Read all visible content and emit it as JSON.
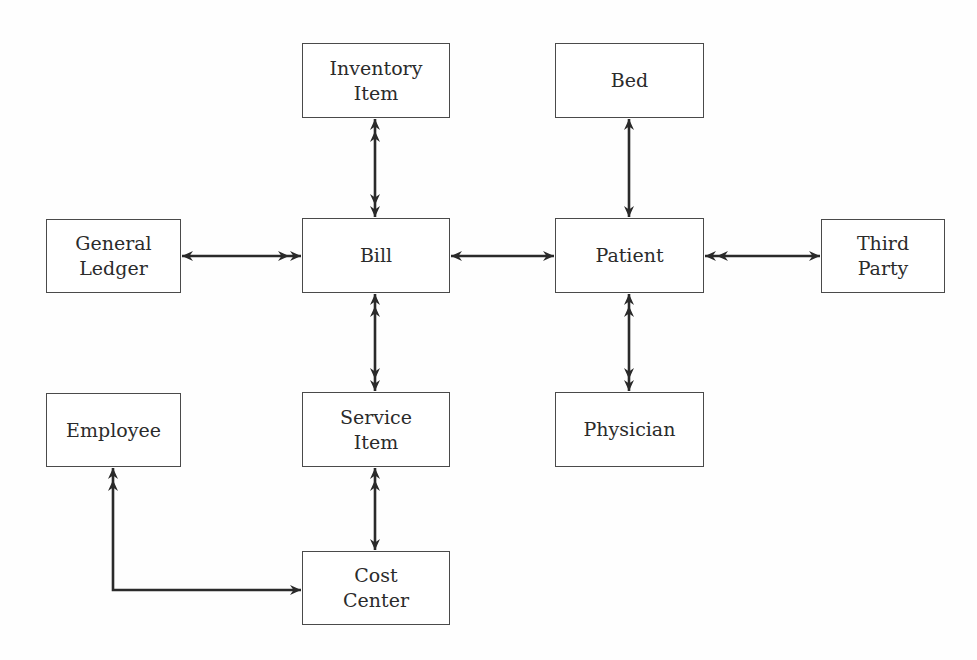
{
  "diagram": {
    "type": "entity-relationship",
    "notation": "single arrowhead = one, double arrowhead = many",
    "colors": {
      "background": "#fefefe",
      "box_border": "#4a4a4a",
      "text": "#2b2b2b",
      "link": "#2a2a2a"
    },
    "entities": [
      {
        "id": "inventory_item",
        "lines": [
          "Inventory",
          "Item"
        ],
        "x": 302,
        "y": 43,
        "w": 148,
        "h": 75
      },
      {
        "id": "bed",
        "lines": [
          "Bed"
        ],
        "x": 555,
        "y": 43,
        "w": 149,
        "h": 75
      },
      {
        "id": "general_ledger",
        "lines": [
          "General",
          "Ledger"
        ],
        "x": 46,
        "y": 219,
        "w": 135,
        "h": 74
      },
      {
        "id": "bill",
        "lines": [
          "Bill"
        ],
        "x": 302,
        "y": 218,
        "w": 148,
        "h": 75
      },
      {
        "id": "patient",
        "lines": [
          "Patient"
        ],
        "x": 555,
        "y": 218,
        "w": 149,
        "h": 75
      },
      {
        "id": "third_party",
        "lines": [
          "Third",
          "Party"
        ],
        "x": 821,
        "y": 219,
        "w": 124,
        "h": 74
      },
      {
        "id": "employee",
        "lines": [
          "Employee"
        ],
        "x": 46,
        "y": 393,
        "w": 135,
        "h": 74
      },
      {
        "id": "service_item",
        "lines": [
          "Service",
          "Item"
        ],
        "x": 302,
        "y": 392,
        "w": 148,
        "h": 75
      },
      {
        "id": "physician",
        "lines": [
          "Physician"
        ],
        "x": 555,
        "y": 392,
        "w": 149,
        "h": 75
      },
      {
        "id": "cost_center",
        "lines": [
          "Cost",
          "Center"
        ],
        "x": 302,
        "y": 551,
        "w": 148,
        "h": 74
      }
    ],
    "relationships": [
      {
        "from": "inventory_item",
        "to": "bill",
        "from_card": "many",
        "to_card": "many",
        "points": [
          [
            375,
            119
          ],
          [
            375,
            217
          ]
        ]
      },
      {
        "from": "bed",
        "to": "patient",
        "from_card": "one",
        "to_card": "one",
        "points": [
          [
            629,
            119
          ],
          [
            629,
            217
          ]
        ]
      },
      {
        "from": "general_ledger",
        "to": "bill",
        "from_card": "one",
        "to_card": "many",
        "points": [
          [
            182,
            256
          ],
          [
            301,
            256
          ]
        ]
      },
      {
        "from": "bill",
        "to": "patient",
        "from_card": "one",
        "to_card": "one",
        "points": [
          [
            451,
            256
          ],
          [
            554,
            256
          ]
        ]
      },
      {
        "from": "patient",
        "to": "third_party",
        "from_card": "many",
        "to_card": "one",
        "points": [
          [
            705,
            256
          ],
          [
            820,
            256
          ]
        ]
      },
      {
        "from": "bill",
        "to": "service_item",
        "from_card": "many",
        "to_card": "many",
        "points": [
          [
            375,
            294
          ],
          [
            375,
            391
          ]
        ]
      },
      {
        "from": "patient",
        "to": "physician",
        "from_card": "many",
        "to_card": "many",
        "points": [
          [
            629,
            294
          ],
          [
            629,
            391
          ]
        ]
      },
      {
        "from": "service_item",
        "to": "cost_center",
        "from_card": "many",
        "to_card": "one",
        "points": [
          [
            375,
            468
          ],
          [
            375,
            550
          ]
        ]
      },
      {
        "from": "employee",
        "to": "cost_center",
        "from_card": "many",
        "to_card": "one",
        "points": [
          [
            113,
            468
          ],
          [
            113,
            590
          ],
          [
            301,
            590
          ]
        ]
      }
    ]
  }
}
